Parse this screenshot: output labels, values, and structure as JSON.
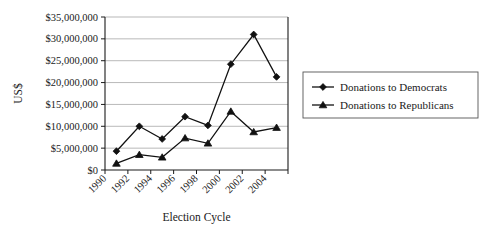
{
  "chart_data": {
    "type": "line",
    "title": "",
    "xlabel": "Election Cycle",
    "ylabel": "US$",
    "grid": true,
    "legend_position": "right",
    "ylim": [
      0,
      35000000
    ],
    "ytick_labels": [
      "$0",
      "$5,000,000",
      "$10,000,000",
      "$15,000,000",
      "$20,000,000",
      "$25,000,000",
      "$30,000,000",
      "$35,000,000"
    ],
    "ytick_values": [
      0,
      5000000,
      10000000,
      15000000,
      20000000,
      25000000,
      30000000,
      35000000
    ],
    "xtick_labels": [
      "1990",
      "1992",
      "1994",
      "1996",
      "1998",
      "2000",
      "2002",
      "2004"
    ],
    "categories": [
      "1990",
      "1992",
      "1994",
      "1996",
      "1998",
      "2000",
      "2002",
      "2004"
    ],
    "series": [
      {
        "name": "Donations to Democrats",
        "marker": "diamond",
        "color": "#111111",
        "values": [
          4300000,
          10000000,
          7100000,
          12200000,
          10200000,
          24200000,
          31000000,
          21300000
        ]
      },
      {
        "name": "Donations to Republicans",
        "marker": "triangle",
        "color": "#111111",
        "values": [
          1500000,
          3500000,
          2900000,
          7300000,
          6100000,
          13400000,
          8700000,
          9700000
        ]
      }
    ]
  },
  "legend": {
    "items": [
      {
        "label": "Donations to Democrats",
        "marker": "diamond"
      },
      {
        "label": "Donations to Republicans",
        "marker": "triangle"
      }
    ]
  },
  "axes": {
    "y_title": "US$",
    "x_title": "Election Cycle"
  }
}
